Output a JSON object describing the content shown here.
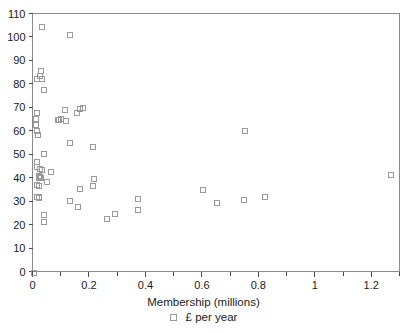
{
  "chart_data": {
    "type": "scatter",
    "title": "",
    "xlabel": "Membership (millions)",
    "ylabel": "",
    "xlim": [
      0,
      1.3
    ],
    "ylim": [
      0,
      110
    ],
    "xticks": [
      0,
      0.2,
      0.4,
      0.6,
      0.8,
      1,
      1.2
    ],
    "xtick_labels": [
      "0",
      "0.2",
      "0.4",
      "0.6",
      "0.8",
      "1",
      "1.2"
    ],
    "xminor_step": 0.1,
    "yticks": [
      0,
      10,
      20,
      30,
      40,
      50,
      60,
      70,
      80,
      90,
      100,
      110
    ],
    "ytick_labels": [
      "0",
      "10",
      "20",
      "30",
      "40",
      "50",
      "60",
      "70",
      "80",
      "90",
      "100",
      "110"
    ],
    "grid": false,
    "legend": {
      "position": "bottom-center",
      "entries": [
        {
          "label": "£ per year",
          "marker": "open-square",
          "color": "#9a9a9a"
        }
      ]
    },
    "series": [
      {
        "name": "£ per year",
        "marker": "open-square",
        "color": "#9a9a9a",
        "points": [
          [
            0.03,
            104.8
          ],
          [
            0.128,
            101.3
          ],
          [
            0.026,
            85.8
          ],
          [
            0.024,
            83.6
          ],
          [
            0.014,
            82.4
          ],
          [
            0.03,
            82.4
          ],
          [
            0.038,
            77.6
          ],
          [
            0.012,
            68.0
          ],
          [
            0.008,
            65.6
          ],
          [
            0.01,
            63.0
          ],
          [
            0.175,
            70.2
          ],
          [
            0.166,
            69.9
          ],
          [
            0.11,
            69.3
          ],
          [
            0.014,
            60.2
          ],
          [
            0.016,
            58.8
          ],
          [
            0.096,
            65.3
          ],
          [
            0.086,
            65.1
          ],
          [
            0.092,
            65.0
          ],
          [
            0.114,
            64.7
          ],
          [
            0.154,
            67.8
          ],
          [
            0.748,
            60.4
          ],
          [
            0.128,
            55.2
          ],
          [
            0.212,
            53.5
          ],
          [
            0.038,
            50.4
          ],
          [
            0.012,
            47.0
          ],
          [
            0.014,
            45.0
          ],
          [
            0.022,
            44.0
          ],
          [
            0.03,
            43.7
          ],
          [
            0.062,
            43.0
          ],
          [
            0.02,
            41.0
          ],
          [
            0.024,
            40.8
          ],
          [
            0.026,
            40.5
          ],
          [
            0.018,
            40.2
          ],
          [
            1.265,
            41.4
          ],
          [
            0.216,
            39.9
          ],
          [
            0.048,
            38.4
          ],
          [
            0.014,
            37.2
          ],
          [
            0.02,
            36.8
          ],
          [
            0.212,
            36.7
          ],
          [
            0.165,
            35.6
          ],
          [
            0.6,
            35.3
          ],
          [
            0.012,
            32.2
          ],
          [
            0.018,
            32.0
          ],
          [
            0.02,
            31.6
          ],
          [
            0.37,
            31.2
          ],
          [
            0.745,
            30.9
          ],
          [
            0.13,
            30.6
          ],
          [
            0.82,
            32.3
          ],
          [
            0.65,
            29.6
          ],
          [
            0.156,
            28.0
          ],
          [
            0.036,
            24.4
          ],
          [
            0.29,
            24.8
          ],
          [
            0.37,
            26.5
          ],
          [
            0.262,
            22.7
          ],
          [
            0.038,
            21.7
          ]
        ]
      }
    ]
  },
  "axis_title": {
    "x": "Membership (millions)"
  },
  "legend_text": {
    "entry": "£ per year"
  },
  "caption": {
    "text": ""
  }
}
